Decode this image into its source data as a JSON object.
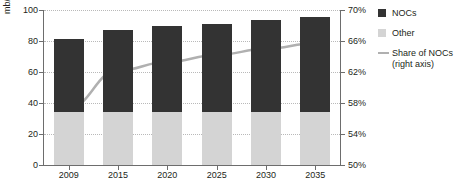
{
  "chart_data": {
    "type": "bar",
    "title": "",
    "xlabel": "",
    "ylabel": "mb/d",
    "categories": [
      "2009",
      "2015",
      "2020",
      "2025",
      "2030",
      "2035"
    ],
    "series": [
      {
        "name": "Other",
        "axis": "left",
        "values": [
          34,
          34,
          34,
          34,
          34,
          34
        ],
        "color": "#d4d4d4"
      },
      {
        "name": "NOCs",
        "axis": "left",
        "values": [
          47,
          53,
          56,
          57,
          59.5,
          61.5
        ],
        "color": "#333333"
      },
      {
        "name": "Share of NOCs (right axis)",
        "type": "line",
        "axis": "right",
        "values": [
          57.4,
          62.2,
          63.3,
          64.2,
          65.0,
          65.7
        ],
        "color": "#b0b0b0"
      }
    ],
    "totals": [
      81,
      87,
      90,
      91,
      93.5,
      95.5
    ],
    "ylim": [
      0,
      100
    ],
    "yticks": [
      0,
      20,
      40,
      60,
      80,
      100
    ],
    "ytick_labels": [
      "0",
      "20",
      "40",
      "60",
      "80",
      "100"
    ],
    "ylim_right": [
      50,
      70
    ],
    "yticks_right": [
      50,
      54,
      58,
      62,
      66,
      70
    ],
    "ytick_labels_right": [
      "50%",
      "54%",
      "58%",
      "62%",
      "66%",
      "70%"
    ],
    "grid": true,
    "legend_position": "right"
  },
  "legend": {
    "items": [
      {
        "label": "NOCs",
        "marker": "square",
        "color": "#333333"
      },
      {
        "label": "Other",
        "marker": "square",
        "color": "#d4d4d4"
      },
      {
        "label": "Share of NOCs",
        "label2": "(right axis)",
        "marker": "line",
        "color": "#b0b0b0"
      }
    ]
  },
  "colors": {
    "nocs": "#333333",
    "other": "#d4d4d4",
    "line": "#b0b0b0",
    "axis": "#6d6d6d",
    "grid": "#b9b9b9",
    "text": "#231f20",
    "background": "#ffffff"
  }
}
